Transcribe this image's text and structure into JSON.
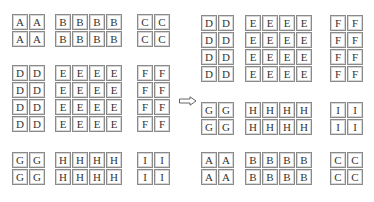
{
  "diagram": {
    "type": "block-rearrangement",
    "left": {
      "block_rows": [
        {
          "rows": 2,
          "blocks": [
            {
              "label": "A",
              "cols": 2
            },
            {
              "label": "B",
              "cols": 4
            },
            {
              "label": "C",
              "cols": 2
            }
          ]
        },
        {
          "rows": 4,
          "blocks": [
            {
              "label": "D",
              "cols": 2
            },
            {
              "label": "E",
              "cols": 4
            },
            {
              "label": "F",
              "cols": 2
            }
          ]
        },
        {
          "rows": 2,
          "blocks": [
            {
              "label": "G",
              "cols": 2
            },
            {
              "label": "H",
              "cols": 4
            },
            {
              "label": "I",
              "cols": 2
            }
          ]
        }
      ]
    },
    "arrow": "right-arrow",
    "right": {
      "block_rows": [
        {
          "rows": 4,
          "blocks": [
            {
              "label": "D",
              "cols": 2
            },
            {
              "label": "E",
              "cols": 4
            },
            {
              "label": "F",
              "cols": 2
            }
          ]
        },
        {
          "rows": 2,
          "blocks": [
            {
              "label": "G",
              "cols": 2
            },
            {
              "label": "H",
              "cols": 4
            },
            {
              "label": "I",
              "cols": 2
            }
          ]
        },
        {
          "rows": 2,
          "blocks": [
            {
              "label": "A",
              "cols": 2
            },
            {
              "label": "B",
              "cols": 4
            },
            {
              "label": "C",
              "cols": 2
            }
          ]
        }
      ]
    },
    "colors": {
      "cell_border": "#8a8a8a",
      "cell_inner": "#d6d6d6",
      "text": "#333333",
      "background": "#ffffff"
    }
  }
}
